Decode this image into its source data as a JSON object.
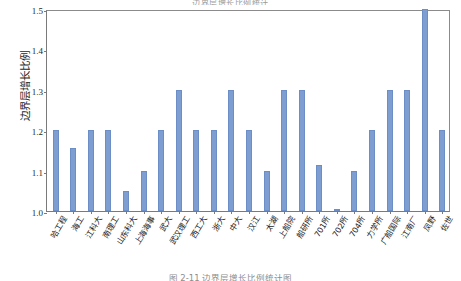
{
  "figure": {
    "top_caption": "边界层增长比例统计",
    "bottom_caption": "图 2-11  边界层增长比例统计图"
  },
  "chart_data": {
    "type": "bar",
    "title": "",
    "xlabel": "",
    "ylabel": "边界层增长比例",
    "ylim": [
      1.0,
      1.5
    ],
    "ytick_labels": [
      "1.0",
      "1.1",
      "1.2",
      "1.3",
      "1.4",
      "1.5"
    ],
    "ytick_values": [
      1.0,
      1.1,
      1.2,
      1.3,
      1.4,
      1.5
    ],
    "grid": false,
    "legend": "none",
    "bar_color": "#7E9DD0",
    "categories": [
      "哈工程",
      "海工",
      "江科大",
      "南理工",
      "山东科大",
      "上海海事",
      "武大",
      "武汉理工",
      "西工大",
      "浙大",
      "中大",
      "汉江",
      "太湖",
      "上船院",
      "船研所",
      "701所",
      "702所",
      "704所",
      "力学所",
      "广船国际",
      "江南厂",
      "凤野",
      "佐世"
    ],
    "values": [
      1.2,
      1.155,
      1.2,
      1.2,
      1.05,
      1.1,
      1.2,
      1.3,
      1.2,
      1.2,
      1.3,
      1.2,
      1.1,
      1.3,
      1.3,
      1.115,
      1.005,
      1.1,
      1.2,
      1.3,
      1.3,
      1.5,
      1.2
    ]
  }
}
